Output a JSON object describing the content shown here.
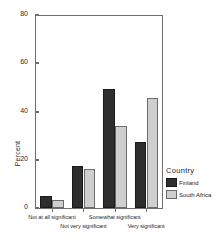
{
  "chart_data": {
    "type": "bar",
    "title": "",
    "xlabel": "",
    "ylabel": "Percent",
    "categories": [
      "Not at all significant",
      "Not very significant",
      "Somewhat significant",
      "Very significant"
    ],
    "series": [
      {
        "name": "Finland",
        "values": [
          5,
          17.5,
          49.5,
          27.5
        ],
        "color": "#2e2e2e"
      },
      {
        "name": "South Africa",
        "values": [
          3.5,
          16,
          34,
          45.5
        ],
        "color": "#cfcfcf"
      }
    ],
    "ylim": [
      0,
      80
    ],
    "yticks": [
      0,
      20,
      40,
      60,
      80
    ],
    "ytick_labels": [
      "0",
      "20",
      "40",
      "60",
      "80"
    ],
    "grid": false,
    "legend": {
      "title": "Country",
      "position": "right",
      "entries": [
        "Finland",
        "South Africa"
      ]
    }
  }
}
